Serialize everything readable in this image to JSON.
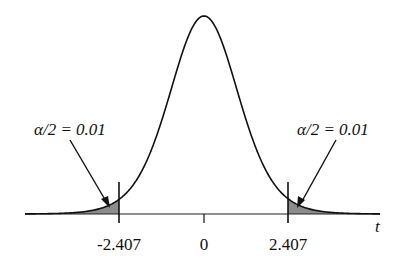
{
  "chart_data": {
    "type": "area",
    "xlabel": "t",
    "ylabel": "",
    "critical_values": [
      -2.407,
      2.407
    ],
    "center": 0,
    "tick_labels": [
      "-2.407",
      "0",
      "2.407"
    ],
    "annotations": [
      {
        "text": "α/2 = 0.01",
        "side": "left",
        "tail_area": 0.01
      },
      {
        "text": "α/2 = 0.01",
        "side": "right",
        "tail_area": 0.01
      }
    ],
    "shade_color": "#8c8c8c",
    "curve_color": "#111111"
  },
  "labels": {
    "left_annotation": "α/2 = 0.01",
    "right_annotation": "α/2 = 0.01",
    "tick_left": "-2.407",
    "tick_center": "0",
    "tick_right": "2.407",
    "axis_var": "t"
  }
}
